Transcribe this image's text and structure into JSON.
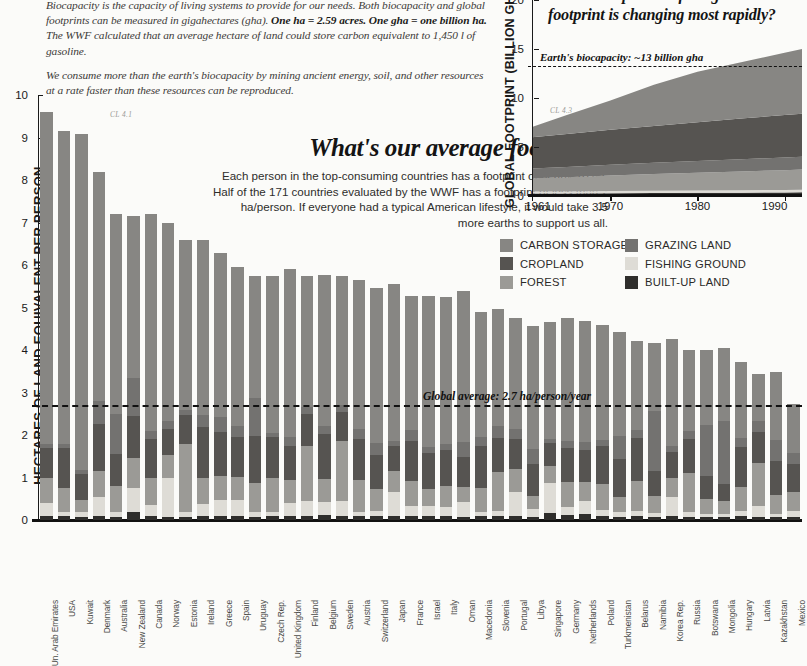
{
  "intro": {
    "paragraphs": [
      "Biocapacity is the capacity of living systems to provide for our needs. Both biocapacity and global footprints can be measured in gigahectares (gha). <b>One ha = 2.59 acres. One gha = one billion ha.</b> The WWF calculated that an average hectare of land could store carbon equivalent to 1,450 l of gasoline.",
      "We consume more than the earth's biocapacity by mining ancient energy, soil, and other resources at a rate faster than these resources can be reproduced."
    ]
  },
  "bar_chart_text": {
    "headline": "What's our average footprint?",
    "body": "Each person in the top-consuming countries has a footprint of nearly 10 ha. Half of the 171 countries evaluated by the WWF has a footprint of less than 2 ha/person. If everyone had a typical American lifestyle, it would take 3.5 more earths to support us all.",
    "cl_tag": "CL 4.1",
    "average_label": "Global average: 2.7 ha/person/year"
  },
  "area_chart_text": {
    "question": "Which component of the global footprint is changing most rapidly?",
    "biocapacity_label": "Earth's biocapacity: ~13 billion gha",
    "cl_tag": "CL 4.3"
  },
  "legend": {
    "columns": [
      [
        {
          "label": "CARBON STORAGE",
          "color": "#878683"
        },
        {
          "label": "CROPLAND",
          "color": "#565451"
        },
        {
          "label": "FOREST",
          "color": "#9b9a96"
        }
      ],
      [
        {
          "label": "GRAZING LAND",
          "color": "#737270"
        },
        {
          "label": "FISHING GROUND",
          "color": "#dedcd6"
        },
        {
          "label": "BUILT-UP LAND",
          "color": "#2f2e2c"
        }
      ]
    ]
  },
  "colors": {
    "carbon_storage": "#878683",
    "cropland": "#565451",
    "forest": "#9b9a96",
    "grazing_land": "#737270",
    "fishing_ground": "#dedcd6",
    "built_up_land": "#2f2e2c",
    "ink": "#1a1a1a",
    "background": "#fbfbf9"
  },
  "chart_data": [
    {
      "id": "footprint-by-country",
      "type": "bar",
      "stacked": true,
      "title": "What's our average footprint?",
      "xlabel": "",
      "ylabel": "HECTARES OF LAND EQUIVALENT PER PERSON",
      "ylim": [
        0,
        10
      ],
      "yticks": [
        0,
        1,
        2,
        3,
        4,
        5,
        6,
        7,
        8,
        9,
        10
      ],
      "grid": false,
      "legend_position": "top-right",
      "annotations": [
        {
          "type": "hline",
          "value": 2.7,
          "label": "Global average: 2.7 ha/person/year",
          "style": "dashed"
        }
      ],
      "series_order": [
        "BUILT-UP LAND",
        "FISHING GROUND",
        "FOREST",
        "CROPLAND",
        "GRAZING LAND",
        "CARBON STORAGE"
      ],
      "categories": [
        "Un. Arab Emirates",
        "USA",
        "Kuwait",
        "Denmark",
        "Australia",
        "New Zealand",
        "Canada",
        "Norway",
        "Estonia",
        "Ireland",
        "Greece",
        "Spain",
        "Uruguay",
        "Czech Rep.",
        "United Kingdom",
        "Finland",
        "Belgium",
        "Sweden",
        "Austria",
        "Switzerland",
        "Japan",
        "France",
        "Israel",
        "Italy",
        "Oman",
        "Macedonia",
        "Slovenia",
        "Portugal",
        "Libya",
        "Singapore",
        "Germany",
        "Netherlands",
        "Poland",
        "Turkmenistan",
        "Belarus",
        "Namibia",
        "Korea Rep.",
        "Russia",
        "Botswana",
        "Mongolia",
        "Hungary",
        "Latvia",
        "Kazakhstan",
        "Mexico"
      ],
      "series": [
        {
          "name": "BUILT-UP LAND",
          "color": "#2f2e2c",
          "values": [
            0.1,
            0.1,
            0.08,
            0.1,
            0.08,
            0.2,
            0.1,
            0.08,
            0.08,
            0.1,
            0.1,
            0.1,
            0.08,
            0.1,
            0.1,
            0.1,
            0.12,
            0.1,
            0.1,
            0.1,
            0.1,
            0.1,
            0.1,
            0.1,
            0.08,
            0.1,
            0.1,
            0.1,
            0.08,
            0.16,
            0.12,
            0.14,
            0.1,
            0.08,
            0.1,
            0.06,
            0.1,
            0.08,
            0.06,
            0.06,
            0.1,
            0.08,
            0.06,
            0.08
          ]
        },
        {
          "name": "FISHING GROUND",
          "color": "#dedcd6",
          "values": [
            0.3,
            0.1,
            0.1,
            0.45,
            0.12,
            0.55,
            0.25,
            0.9,
            0.1,
            0.28,
            0.38,
            0.36,
            0.1,
            0.1,
            0.3,
            0.35,
            0.3,
            0.35,
            0.1,
            0.12,
            0.55,
            0.22,
            0.22,
            0.2,
            0.35,
            0.1,
            0.12,
            0.55,
            0.18,
            0.7,
            0.18,
            0.3,
            0.14,
            0.1,
            0.12,
            0.1,
            0.45,
            0.12,
            0.08,
            0.08,
            0.12,
            0.25,
            0.08,
            0.14
          ]
        },
        {
          "name": "FOREST",
          "color": "#9b9a96",
          "values": [
            0.6,
            0.55,
            0.3,
            0.6,
            0.6,
            0.7,
            0.65,
            0.55,
            1.6,
            0.6,
            0.55,
            0.55,
            0.7,
            0.8,
            0.55,
            1.3,
            0.55,
            1.4,
            0.75,
            0.5,
            0.5,
            0.6,
            0.4,
            0.5,
            0.35,
            0.55,
            0.9,
            0.55,
            0.3,
            0.4,
            0.6,
            0.45,
            0.6,
            0.35,
            0.7,
            0.4,
            0.45,
            0.9,
            0.35,
            0.3,
            0.55,
            1.0,
            0.45,
            0.45
          ]
        },
        {
          "name": "CROPLAND",
          "color": "#565451",
          "values": [
            0.7,
            0.95,
            0.6,
            1.1,
            0.75,
            1.0,
            0.9,
            0.6,
            0.7,
            1.2,
            1.05,
            0.95,
            1.1,
            0.95,
            0.8,
            0.75,
            1.05,
            0.7,
            0.95,
            0.8,
            0.6,
            0.95,
            0.85,
            0.85,
            0.7,
            1.0,
            0.8,
            0.7,
            0.75,
            0.55,
            0.8,
            0.75,
            0.9,
            0.9,
            1.0,
            0.6,
            0.6,
            0.8,
            0.55,
            0.4,
            0.95,
            0.75,
            0.8,
            0.65
          ]
        },
        {
          "name": "GRAZING LAND",
          "color": "#737270",
          "values": [
            0.1,
            0.1,
            0.1,
            0.55,
            0.95,
            0.9,
            0.2,
            0.2,
            0.1,
            0.3,
            0.35,
            0.25,
            0.9,
            0.1,
            0.2,
            0.15,
            0.2,
            0.15,
            0.25,
            0.3,
            0.1,
            0.25,
            0.15,
            0.15,
            0.35,
            0.2,
            0.3,
            0.25,
            0.35,
            0.1,
            0.15,
            0.2,
            0.15,
            0.55,
            0.2,
            1.4,
            0.15,
            0.2,
            1.2,
            1.5,
            0.2,
            0.25,
            0.5,
            0.25
          ]
        },
        {
          "name": "CARBON STORAGE",
          "color": "#878683",
          "values": [
            7.8,
            7.35,
            7.9,
            5.4,
            4.7,
            3.8,
            5.1,
            4.65,
            4.0,
            4.1,
            3.85,
            3.75,
            2.85,
            3.7,
            3.95,
            3.1,
            3.55,
            3.05,
            3.5,
            3.65,
            3.7,
            3.15,
            3.55,
            3.45,
            3.55,
            2.95,
            2.75,
            2.6,
            2.9,
            2.75,
            2.9,
            2.85,
            2.7,
            2.45,
            2.1,
            1.6,
            2.5,
            1.9,
            1.75,
            1.7,
            1.8,
            1.1,
            1.6,
            1.15
          ]
        }
      ],
      "totals": [
        9.6,
        9.15,
        9.08,
        8.2,
        7.2,
        7.15,
        7.2,
        6.98,
        6.58,
        6.58,
        6.28,
        5.96,
        5.73,
        5.75,
        5.9,
        5.75,
        5.77,
        5.75,
        5.55,
        5.47,
        5.55,
        5.27,
        5.27,
        5.25,
        5.38,
        4.9,
        4.97,
        4.75,
        4.56,
        4.66,
        4.75,
        4.69,
        4.59,
        4.43,
        4.22,
        4.16,
        4.25,
        4.0,
        3.99,
        4.04,
        3.72,
        3.43,
        3.49,
        2.72
      ]
    },
    {
      "id": "global-footprint-over-time",
      "type": "area",
      "stacked": true,
      "title": "Which component of the global footprint is changing most rapidly?",
      "xlabel": "",
      "ylabel": "GLOBAL FOOTPRINT (BILLION GHA)",
      "ylim": [
        0,
        20
      ],
      "yticks": [
        0,
        5,
        10,
        15,
        20
      ],
      "xlim": [
        1961,
        1992
      ],
      "xticks": [
        1961,
        1970,
        1980,
        1990
      ],
      "grid": false,
      "annotations": [
        {
          "type": "hline",
          "value": 13.3,
          "label": "Earth's biocapacity: ~13 billion gha",
          "style": "dashed"
        }
      ],
      "x": [
        1961,
        1965,
        1970,
        1975,
        1980,
        1985,
        1990,
        1992
      ],
      "series": [
        {
          "name": "BUILT-UP LAND",
          "color": "#2f2e2c",
          "values": [
            0.25,
            0.26,
            0.28,
            0.3,
            0.32,
            0.34,
            0.36,
            0.37
          ]
        },
        {
          "name": "FISHING GROUND",
          "color": "#dedcd6",
          "values": [
            0.2,
            0.21,
            0.22,
            0.23,
            0.24,
            0.25,
            0.26,
            0.26
          ]
        },
        {
          "name": "FOREST",
          "color": "#9b9a96",
          "values": [
            1.35,
            1.45,
            1.6,
            1.72,
            1.82,
            1.92,
            2.02,
            2.07
          ]
        },
        {
          "name": "GRAZING LAND",
          "color": "#737270",
          "values": [
            1.0,
            1.05,
            1.1,
            1.15,
            1.2,
            1.24,
            1.28,
            1.3
          ]
        },
        {
          "name": "CROPLAND",
          "color": "#565451",
          "values": [
            3.2,
            3.35,
            3.55,
            3.75,
            3.95,
            4.15,
            4.35,
            4.4
          ]
        },
        {
          "name": "CARBON STORAGE",
          "color": "#878683",
          "values": [
            1.05,
            1.95,
            3.0,
            4.2,
            5.15,
            5.75,
            6.35,
            6.6
          ]
        }
      ],
      "totals": [
        7.05,
        8.27,
        9.75,
        11.35,
        12.68,
        13.65,
        14.62,
        15.0
      ]
    }
  ]
}
